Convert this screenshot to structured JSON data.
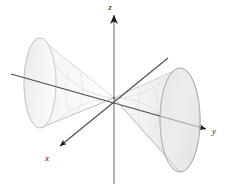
{
  "figure": {
    "background_color": "#ffffff",
    "axes": {
      "line_color": "#4a4a4a",
      "arrow_color": "#1a1a1a",
      "z": {
        "label": "z",
        "label_x": 113,
        "label_y": 8,
        "line": {
          "x1": 114,
          "y1": 13,
          "x2": 114,
          "y2": 184
        },
        "arrow_tip": {
          "x": 114,
          "y": 12
        },
        "direction": "up"
      },
      "y": {
        "label": "y",
        "label_x": 214,
        "label_y": 133,
        "line": {
          "x1": 11,
          "y1": 74,
          "x2": 207,
          "y2": 129
        },
        "arrow_tip": {
          "x": 208,
          "y": 129
        },
        "direction": "right"
      },
      "x": {
        "label": "x",
        "label_x": 47,
        "label_y": 160,
        "line": {
          "x1": 168,
          "y1": 58,
          "x2": 59,
          "y2": 147
        },
        "arrow_tip": {
          "x": 57,
          "y": 149
        },
        "direction": "lower-left"
      }
    },
    "origin": {
      "x": 114,
      "y": 98
    },
    "cones": [
      {
        "name": "left-nappe",
        "direction": "negative-y",
        "apex": {
          "x": 114,
          "y": 98
        },
        "base_center": {
          "x": 40,
          "y": 83
        },
        "base_rx": 16,
        "base_ry": 45,
        "fill_color": "#f4f4f4",
        "stroke_color": "#b8b8b8"
      },
      {
        "name": "right-nappe",
        "direction": "positive-y",
        "apex": {
          "x": 114,
          "y": 98
        },
        "base_center": {
          "x": 180,
          "y": 120
        },
        "base_rx": 20,
        "base_ry": 52,
        "fill_color": "#ebebeb",
        "stroke_color": "#b0b0b0"
      }
    ],
    "colors": {
      "surface_light": "#f6f6f6",
      "surface_mid": "#ebebeb",
      "surface_shade": "#e0e0e0",
      "outline": "#b8b8b8",
      "axis": "#4a4a4a",
      "label": "#1a1a1a"
    }
  }
}
